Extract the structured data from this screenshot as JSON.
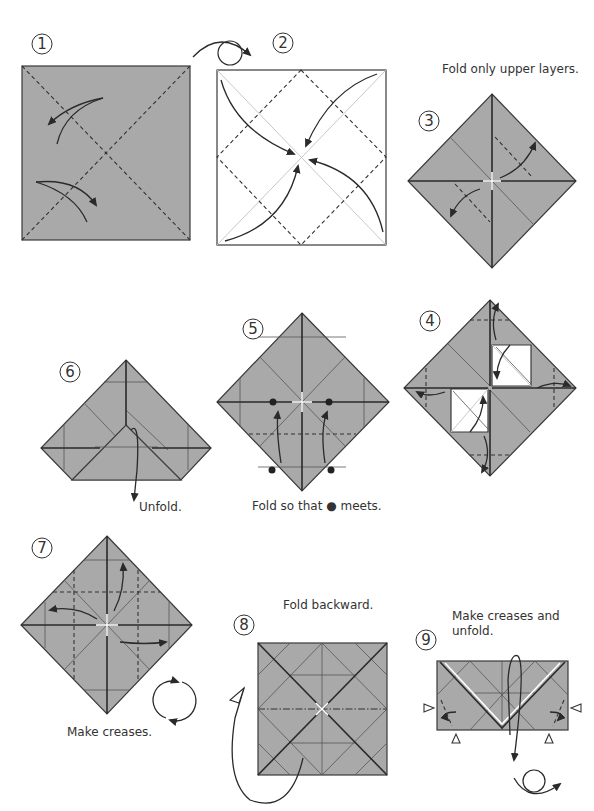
{
  "page": {
    "paper_color": "#a9a9a9",
    "line_color": "#2a2a2a"
  },
  "steps": [
    {
      "number": "1",
      "caption": ""
    },
    {
      "number": "2",
      "caption": ""
    },
    {
      "number": "3",
      "caption": "Fold only upper layers."
    },
    {
      "number": "4",
      "caption": ""
    },
    {
      "number": "5",
      "caption": "Fold so that ● meets."
    },
    {
      "number": "6",
      "caption": "Unfold."
    },
    {
      "number": "7",
      "caption": "Make creases."
    },
    {
      "number": "8",
      "caption": "Fold backward."
    },
    {
      "number": "9",
      "caption_line1": "Make creases and",
      "caption_line2": "unfold."
    }
  ],
  "symbols": {
    "turn_over": "turn-over-icon",
    "rotate": "rotate-icon",
    "valley_fold": "dashed-line",
    "mountain_fold": "dash-dot-line",
    "reference_point": "black-dot",
    "inside_reverse_marker": "open-triangle"
  }
}
